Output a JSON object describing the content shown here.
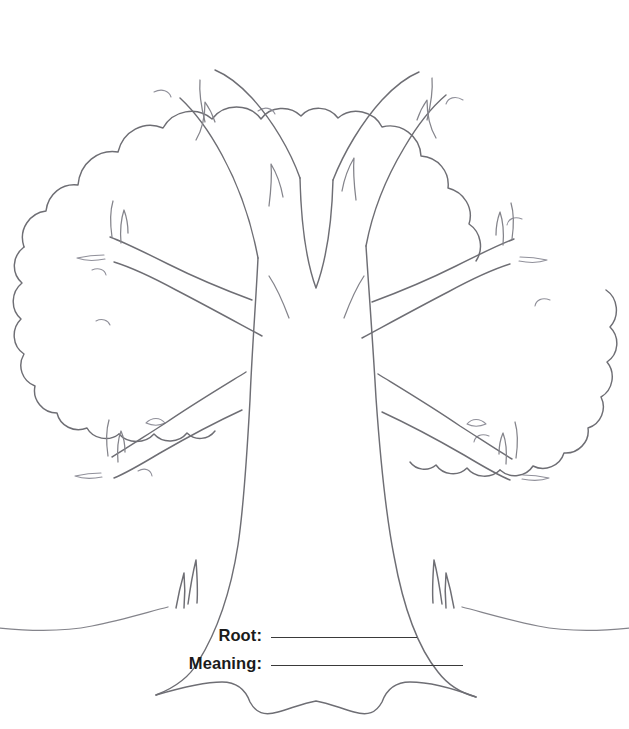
{
  "page": {
    "background_color": "#ffffff",
    "width": 629,
    "height": 729
  },
  "artwork": {
    "name": "tree-line-drawing",
    "description": "Black-and-white line-art outline of a broad leafy tree with a thick flaring trunk, branching limbs and a cloud-shaped scalloped canopy, standing on a ground line with small grass tufts and spreading surface roots.",
    "style": "outline / coloring-page line art",
    "line_color": "#6e6e74",
    "fill_color": "#ffffff"
  },
  "form": {
    "rows": [
      {
        "label": "Root:",
        "value": "",
        "rule_width": 146
      },
      {
        "label": "Meaning:",
        "value": "",
        "rule_width": 192
      }
    ],
    "rule_color": "#3a3a3a",
    "label_color": "#1b1b1b"
  }
}
